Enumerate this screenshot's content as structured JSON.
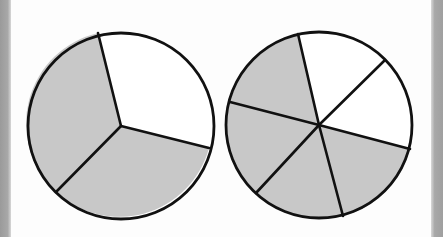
{
  "colors": {
    "shaded": "#c8c8c8",
    "unshaded": "#ffffff",
    "outline": "#111111",
    "background": "#fdfdfd",
    "border_strip": "#a4a4a4"
  },
  "diagram": {
    "circles": [
      {
        "name": "thirds",
        "center": [
          121,
          126
        ],
        "radius": 93,
        "parts": 3,
        "shaded_parts": 2,
        "spoke_endpoints": [
          [
            98,
            33
          ],
          [
            209,
            148
          ],
          [
            56,
            192
          ]
        ],
        "sectors": [
          {
            "from": [
              98,
              33
            ],
            "to": [
              209,
              148
            ],
            "shaded": false
          },
          {
            "from": [
              209,
              148
            ],
            "to": [
              56,
              192
            ],
            "shaded": true
          },
          {
            "from": [
              56,
              192
            ],
            "to": [
              98,
              33
            ],
            "shaded": true
          }
        ]
      },
      {
        "name": "sixths",
        "center": [
          319,
          125
        ],
        "radius": 93,
        "parts": 6,
        "shaded_parts": 4,
        "spoke_endpoints": [
          [
            298,
            34
          ],
          [
            384,
            61
          ],
          [
            410,
            149
          ],
          [
            343,
            216
          ],
          [
            256,
            193
          ],
          [
            230,
            102
          ]
        ],
        "sectors": [
          {
            "from": [
              298,
              34
            ],
            "to": [
              384,
              61
            ],
            "shaded": false
          },
          {
            "from": [
              384,
              61
            ],
            "to": [
              410,
              149
            ],
            "shaded": false
          },
          {
            "from": [
              410,
              149
            ],
            "to": [
              343,
              216
            ],
            "shaded": true
          },
          {
            "from": [
              343,
              216
            ],
            "to": [
              256,
              193
            ],
            "shaded": true
          },
          {
            "from": [
              256,
              193
            ],
            "to": [
              230,
              102
            ],
            "shaded": true
          },
          {
            "from": [
              230,
              102
            ],
            "to": [
              298,
              34
            ],
            "shaded": true
          }
        ]
      }
    ]
  }
}
